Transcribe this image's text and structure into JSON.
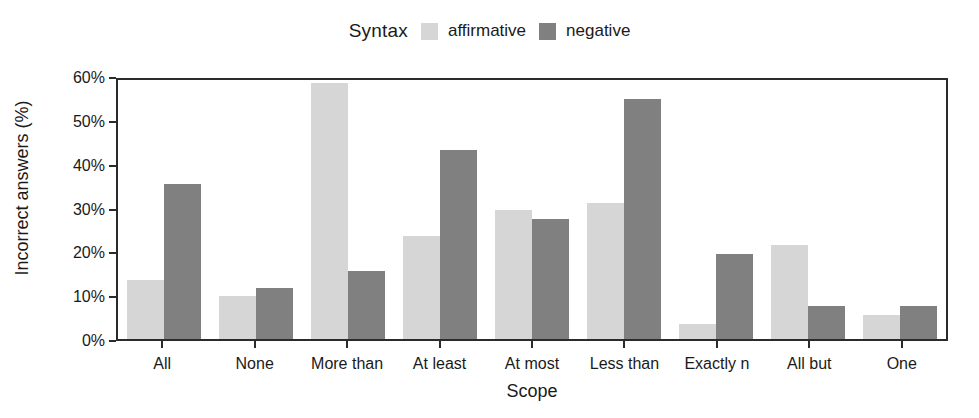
{
  "chart_data": {
    "type": "bar",
    "title": "",
    "xlabel": "Scope",
    "ylabel": "Incorrect answers (%)",
    "ylim": [
      0,
      60
    ],
    "grid": false,
    "legend_position": "top",
    "legend_title": "Syntax",
    "ytick_labels": [
      "60%",
      "50%",
      "40%",
      "30%",
      "20%",
      "10%",
      "0%"
    ],
    "ytick_values": [
      60,
      50,
      40,
      30,
      20,
      10,
      0
    ],
    "categories": [
      "All",
      "None",
      "More than",
      "At least",
      "At most",
      "Less than",
      "Exactly n",
      "All but",
      "One"
    ],
    "series": [
      {
        "name": "affirmative",
        "color": "#d6d6d6",
        "values": [
          13.5,
          9.7,
          58.4,
          23.5,
          29.4,
          31.1,
          3.5,
          21.4,
          5.5
        ]
      },
      {
        "name": "negative",
        "color": "#808080",
        "values": [
          35.4,
          11.7,
          15.6,
          43.1,
          27.3,
          54.8,
          19.5,
          7.5,
          7.5
        ]
      }
    ]
  },
  "colors": {
    "axis": "#2b2b2b",
    "text": "#1a1a1a",
    "panel_background": "#ffffff",
    "affirmative": "#d6d6d6",
    "negative": "#808080"
  }
}
